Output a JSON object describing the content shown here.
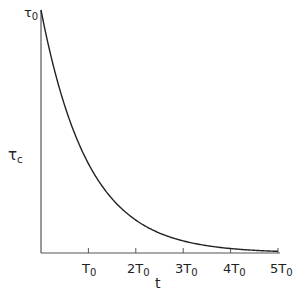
{
  "chart_data": {
    "type": "line",
    "title": "",
    "xlabel": "t",
    "ylabel": "τc",
    "y_top_label": "τ0",
    "x_tick_labels": [
      "T0",
      "2T0",
      "3T0",
      "4T0",
      "5T0"
    ],
    "x_ticks": [
      1,
      2,
      3,
      4,
      5
    ],
    "xlim": [
      0,
      5
    ],
    "ylim": [
      0,
      1
    ],
    "grid": false,
    "legend": null,
    "series": [
      {
        "name": "τc = τ0·exp(-t/T0)",
        "x": [
          0,
          0.5,
          1,
          1.5,
          2,
          2.5,
          3,
          3.5,
          4,
          4.5,
          5
        ],
        "values": [
          1.0,
          0.607,
          0.368,
          0.223,
          0.135,
          0.082,
          0.05,
          0.03,
          0.018,
          0.011,
          0.007
        ]
      }
    ]
  },
  "labels": {
    "y_top": "τ",
    "y_top_sub": "0",
    "y_axis": "τ",
    "y_axis_sub": "c",
    "x_axis": "t",
    "ticks": [
      {
        "pre": "",
        "main": "T",
        "sub": "0"
      },
      {
        "pre": "2",
        "main": "T",
        "sub": "0"
      },
      {
        "pre": "3",
        "main": "T",
        "sub": "0"
      },
      {
        "pre": "4",
        "main": "T",
        "sub": "0"
      },
      {
        "pre": "5",
        "main": "T",
        "sub": "0"
      }
    ]
  },
  "colors": {
    "axis": "#555555",
    "curve": "#222222"
  }
}
